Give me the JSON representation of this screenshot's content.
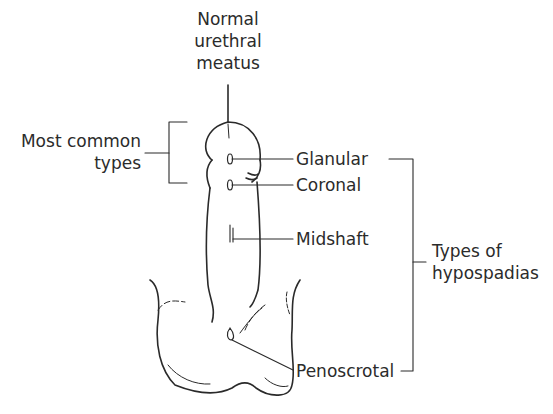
{
  "diagram": {
    "title_label": [
      "Normal",
      "urethral",
      "meatus"
    ],
    "common_label": [
      "Most common",
      "types"
    ],
    "types": [
      {
        "name": "Glanular"
      },
      {
        "name": "Coronal"
      },
      {
        "name": "Midshaft"
      },
      {
        "name": "Penoscrotal"
      }
    ],
    "group_label": [
      "Types of",
      "hypospadias"
    ],
    "colors": {
      "line": "#2a2a2a",
      "text": "#2b2b2b",
      "background": "#ffffff"
    }
  }
}
